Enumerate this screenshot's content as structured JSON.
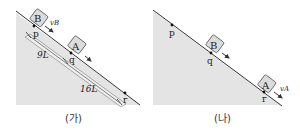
{
  "colors": {
    "incline_fill": "#e4e4e4",
    "incline_edge": "#333333",
    "block_fill": "#dcdcdc",
    "block_edge": "#555555",
    "point": "#111111",
    "background": "#ffffff"
  },
  "panel_a": {
    "caption": "(가)",
    "block_b": {
      "label": "B",
      "velocity_label": "vB"
    },
    "block_a": {
      "label": "A"
    },
    "points": {
      "p": "p",
      "q": "q",
      "r": "r"
    },
    "distance_pq": "9L",
    "distance_qr": "16L"
  },
  "panel_b": {
    "caption": "(나)",
    "block_b": {
      "label": "B"
    },
    "block_a": {
      "label": "A",
      "velocity_label": "vA"
    },
    "points": {
      "p": "p",
      "q": "q",
      "r": "r"
    }
  }
}
